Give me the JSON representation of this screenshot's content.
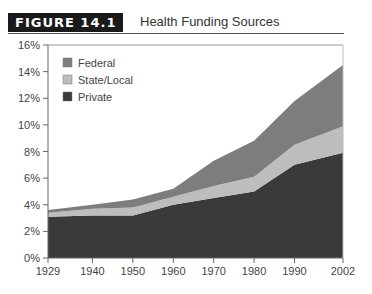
{
  "figure": {
    "label": "FIGURE 14.1",
    "title": "Health Funding Sources"
  },
  "colors": {
    "federal": "#7d7d7d",
    "state_local": "#bdbdbd",
    "private": "#3a3a3a"
  },
  "chart_data": {
    "type": "area",
    "stacked": true,
    "title": "Health Funding Sources",
    "xlabel": "",
    "ylabel": "",
    "x": [
      1929,
      1940,
      1950,
      1960,
      1970,
      1980,
      1990,
      2002
    ],
    "x_tick_labels": [
      "1929",
      "1940",
      "1950",
      "1960",
      "1970",
      "1980",
      "1990",
      "2002"
    ],
    "y_tick_labels": [
      "0%",
      "2%",
      "4%",
      "6%",
      "8%",
      "10%",
      "12%",
      "14%",
      "16%"
    ],
    "ylim": [
      0,
      16
    ],
    "grid": false,
    "legend_position": "upper left",
    "series": [
      {
        "name": "Private",
        "values": [
          3.1,
          3.2,
          3.2,
          4.0,
          4.5,
          5.0,
          7.0,
          7.9
        ]
      },
      {
        "name": "State/Local",
        "values": [
          0.3,
          0.5,
          0.6,
          0.6,
          0.9,
          1.1,
          1.5,
          2.0
        ]
      },
      {
        "name": "Federal",
        "values": [
          0.2,
          0.3,
          0.6,
          0.6,
          1.9,
          2.7,
          3.3,
          4.6
        ]
      }
    ],
    "legend": [
      "Federal",
      "State/Local",
      "Private"
    ]
  }
}
